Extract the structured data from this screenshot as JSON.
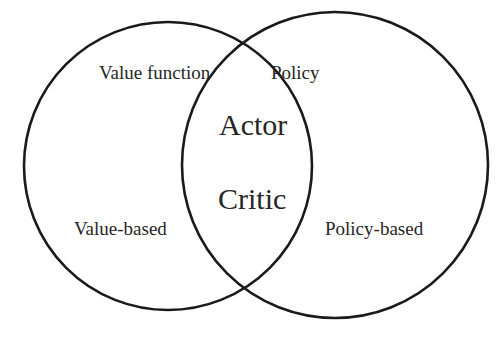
{
  "diagram": {
    "type": "venn",
    "circles": [
      {
        "name": "value-based",
        "cx": 168,
        "cy": 166,
        "r": 144,
        "stroke": "#1a1a1a"
      },
      {
        "name": "policy-based",
        "cx": 335,
        "cy": 165,
        "r": 153,
        "stroke": "#1a1a1a"
      }
    ],
    "labels": {
      "value_function": "Value function",
      "policy": "Policy",
      "actor": "Actor",
      "critic": "Critic",
      "value_based": "Value-based",
      "policy_based": "Policy-based"
    }
  }
}
